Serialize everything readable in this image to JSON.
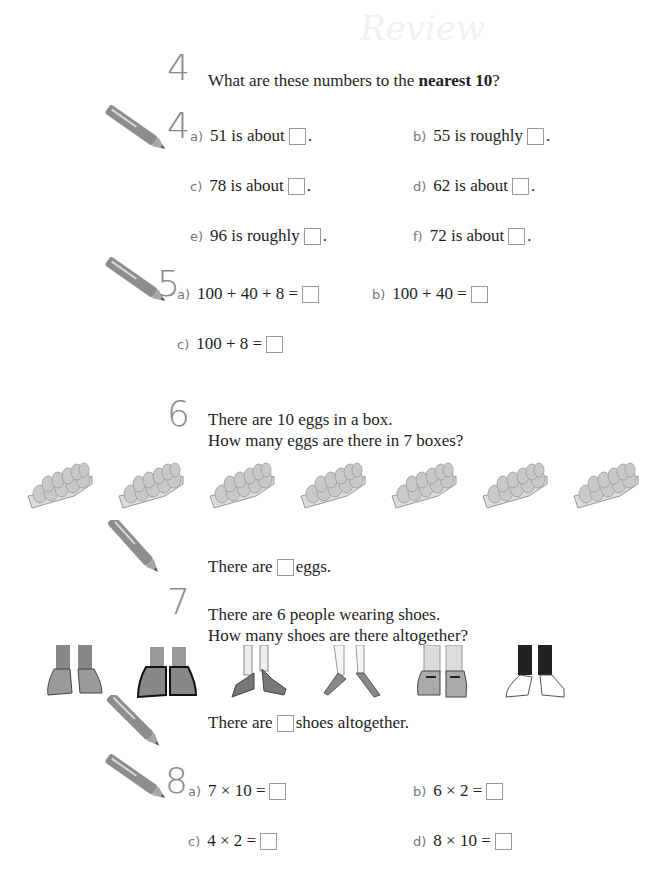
{
  "header": {
    "faint_title": "Review"
  },
  "q4": {
    "number": "4",
    "prompt_pre": "What are these numbers to the ",
    "prompt_bold": "nearest 10",
    "prompt_post": "?"
  },
  "q4b": {
    "number": "4",
    "items": [
      {
        "label": "a)",
        "text": "51 is about",
        "end": "."
      },
      {
        "label": "b)",
        "text": "55 is roughly",
        "end": "."
      },
      {
        "label": "c)",
        "text": "78 is about",
        "end": "."
      },
      {
        "label": "d)",
        "text": "62 is about",
        "end": "."
      },
      {
        "label": "e)",
        "text": "96 is roughly",
        "end": "."
      },
      {
        "label": "f)",
        "text": "72 is about",
        "end": "."
      }
    ]
  },
  "q5": {
    "number": "5",
    "items": [
      {
        "label": "a)",
        "text": "100 + 40 + 8 ="
      },
      {
        "label": "b)",
        "text": "100 + 40 ="
      },
      {
        "label": "c)",
        "text": "100 + 8 ="
      }
    ]
  },
  "q6": {
    "number": "6",
    "line1": "There are 10 eggs in a box.",
    "line2": "How many eggs are there in 7 boxes?",
    "egg_box_count": 7,
    "answer_pre": "There are",
    "answer_post": "eggs."
  },
  "q7": {
    "number": "7",
    "line1": "There are 6 people wearing shoes.",
    "line2": "How many shoes are there altogether?",
    "shoe_pair_count": 6,
    "answer_pre": "There are",
    "answer_post": "shoes altogether."
  },
  "q8": {
    "number": "8",
    "items": [
      {
        "label": "a)",
        "text": "7 × 10 ="
      },
      {
        "label": "b)",
        "text": "6 × 2 ="
      },
      {
        "label": "c)",
        "text": "4 × 2 ="
      },
      {
        "label": "d)",
        "text": "8 × 10 ="
      }
    ]
  },
  "icons": {
    "pencil": "pencil-icon",
    "egg_box": "egg-carton-icon",
    "shoes": "shoes-icon"
  }
}
